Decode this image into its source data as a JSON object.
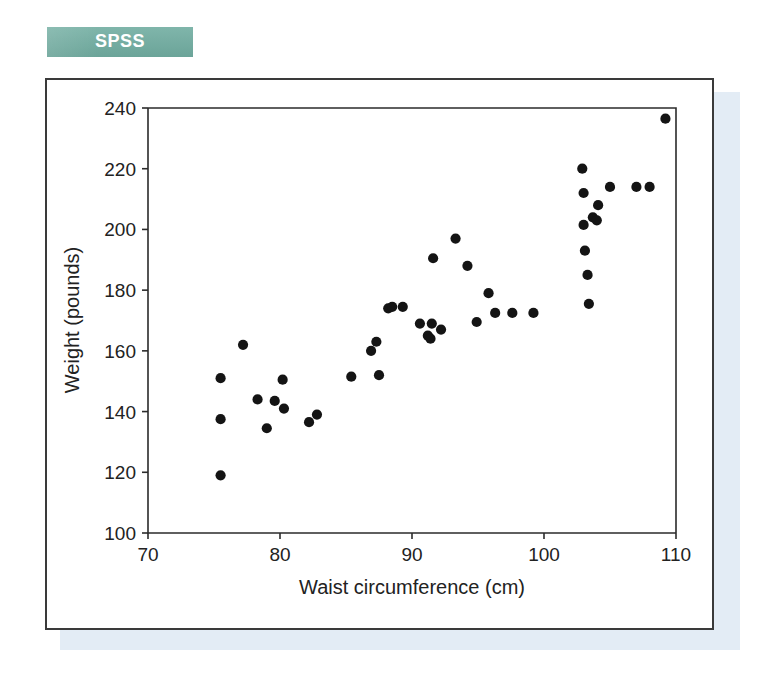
{
  "banner": {
    "label": "SPSS"
  },
  "chart_data": {
    "type": "scatter",
    "title": "",
    "xlabel": "Waist circumference (cm)",
    "ylabel": "Weight (pounds)",
    "xlim": [
      70,
      110
    ],
    "ylim": [
      100,
      240
    ],
    "xticks": [
      70,
      80,
      90,
      100,
      110
    ],
    "yticks": [
      100,
      120,
      140,
      160,
      180,
      200,
      220,
      240
    ],
    "xtick_labels": [
      "70",
      "80",
      "90",
      "100",
      "110"
    ],
    "ytick_labels": [
      "100",
      "120",
      "140",
      "160",
      "180",
      "200",
      "220",
      "240"
    ],
    "grid": false,
    "legend": null,
    "marker": "filled-circle",
    "marker_color": "#141414",
    "x": [
      75.5,
      75.5,
      75.5,
      77.2,
      78.3,
      79.0,
      79.6,
      80.2,
      80.3,
      82.2,
      82.8,
      85.4,
      86.9,
      87.3,
      87.5,
      88.2,
      88.5,
      89.3,
      90.6,
      91.2,
      91.4,
      91.5,
      91.6,
      92.2,
      93.3,
      94.2,
      94.9,
      95.8,
      96.3,
      97.6,
      99.2,
      102.9,
      103.0,
      103.0,
      103.1,
      103.3,
      103.4,
      103.7,
      104.0,
      104.1,
      105.0,
      107.0,
      108.0,
      109.2
    ],
    "y": [
      151,
      137.5,
      119,
      162,
      144,
      134.5,
      143.5,
      150.5,
      141,
      136.5,
      139,
      151.5,
      160,
      163,
      152,
      174,
      174.5,
      174.5,
      169,
      165,
      164,
      169,
      190.5,
      167,
      197,
      188,
      169.5,
      179,
      172.5,
      172.5,
      172.5,
      220,
      212,
      201.5,
      193,
      185,
      175.5,
      204,
      203,
      208,
      214,
      214,
      214,
      236.5
    ],
    "points": [
      {
        "x": 75.5,
        "y": 151
      },
      {
        "x": 75.5,
        "y": 137.5
      },
      {
        "x": 75.5,
        "y": 119
      },
      {
        "x": 77.2,
        "y": 162
      },
      {
        "x": 78.3,
        "y": 144
      },
      {
        "x": 79.0,
        "y": 134.5
      },
      {
        "x": 79.6,
        "y": 143.5
      },
      {
        "x": 80.2,
        "y": 150.5
      },
      {
        "x": 80.3,
        "y": 141
      },
      {
        "x": 82.2,
        "y": 136.5
      },
      {
        "x": 82.8,
        "y": 139
      },
      {
        "x": 85.4,
        "y": 151.5
      },
      {
        "x": 86.9,
        "y": 160
      },
      {
        "x": 87.3,
        "y": 163
      },
      {
        "x": 87.5,
        "y": 152
      },
      {
        "x": 88.2,
        "y": 174
      },
      {
        "x": 88.5,
        "y": 174.5
      },
      {
        "x": 89.3,
        "y": 174.5
      },
      {
        "x": 90.6,
        "y": 169
      },
      {
        "x": 91.2,
        "y": 165
      },
      {
        "x": 91.4,
        "y": 164
      },
      {
        "x": 91.5,
        "y": 169
      },
      {
        "x": 91.6,
        "y": 190.5
      },
      {
        "x": 92.2,
        "y": 167
      },
      {
        "x": 93.3,
        "y": 197
      },
      {
        "x": 94.2,
        "y": 188
      },
      {
        "x": 94.9,
        "y": 169.5
      },
      {
        "x": 95.8,
        "y": 179
      },
      {
        "x": 96.3,
        "y": 172.5
      },
      {
        "x": 97.6,
        "y": 172.5
      },
      {
        "x": 99.2,
        "y": 172.5
      },
      {
        "x": 102.9,
        "y": 220
      },
      {
        "x": 103.0,
        "y": 212
      },
      {
        "x": 103.0,
        "y": 201.5
      },
      {
        "x": 103.1,
        "y": 193
      },
      {
        "x": 103.3,
        "y": 185
      },
      {
        "x": 103.4,
        "y": 175.5
      },
      {
        "x": 103.7,
        "y": 204
      },
      {
        "x": 104.0,
        "y": 203
      },
      {
        "x": 104.1,
        "y": 208
      },
      {
        "x": 105.0,
        "y": 214
      },
      {
        "x": 107.0,
        "y": 214
      },
      {
        "x": 108.0,
        "y": 214
      },
      {
        "x": 109.2,
        "y": 236.5
      }
    ]
  }
}
